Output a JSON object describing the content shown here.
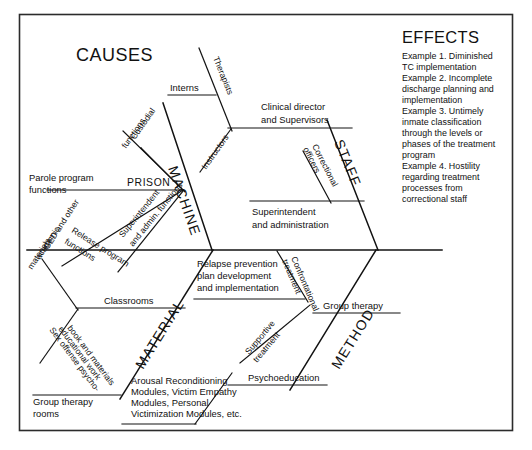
{
  "diagram": {
    "type": "fishbone-ishikawa",
    "causes_heading": "CAUSES",
    "effects": {
      "title": "EFFECTS",
      "lines": [
        "Example 1. Diminished",
        "TC implementation",
        "Example 2. Incomplete",
        "discharge planning and",
        "implementation",
        "Example 3. Untimely",
        "inmate classification",
        "through the levels or",
        "phases of the treatment",
        "program",
        "Example 4. Hostility",
        "regarding treatment",
        "processes from",
        "correctional staff"
      ]
    },
    "categories": {
      "machine": "MACHINE",
      "staff": "STAFF",
      "material": "MATERIAL",
      "method": "METHOD"
    },
    "machine_branch": {
      "node_label": "PRISON",
      "items": [
        "Parole program",
        "functions",
        "Custodial",
        "functions",
        "Release program",
        "functions",
        "Superintendent",
        "and admin. functions"
      ]
    },
    "staff_branch": {
      "items": [
        "Clinical director",
        "and Supervisors",
        "Therapists",
        "Interns",
        "Instructors",
        "Correctional",
        "officers",
        "Superintendent",
        "and administration"
      ]
    },
    "material_branch": {
      "items": [
        "Classrooms",
        "GED and other",
        "academic",
        "materials",
        "Sex offense psycho-",
        "educational work",
        "book and materials",
        "Group therapy",
        "rooms",
        "Arousal Reconditioning",
        "Modules, Victim Empathy",
        "Modules, Personal",
        "Victimization Modules, etc."
      ]
    },
    "method_branch": {
      "items": [
        "Relapse prevention",
        "plan development",
        "and implementation",
        "Confrontational",
        "treatment",
        "Group therapy",
        "Supportive",
        "treatment",
        "Psychoeducation"
      ]
    },
    "colors": {
      "line": "#121212",
      "frame": "#2b2b2b",
      "text": "#111111",
      "background": "#ffffff"
    }
  }
}
